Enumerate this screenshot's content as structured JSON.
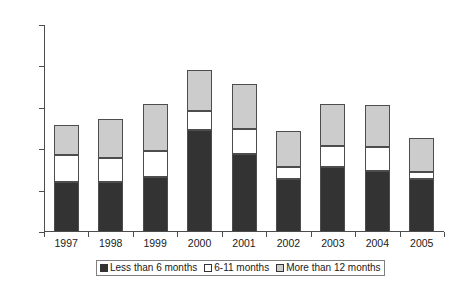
{
  "chart_data": {
    "type": "bar",
    "stacked": true,
    "title": "",
    "subtitle": "",
    "xlabel": "",
    "ylabel": "",
    "ylim": [
      0,
      25000
    ],
    "ytick_step": 5000,
    "ytick_labels": [
      "0",
      "5000",
      "10000",
      "15000",
      "20000",
      "25000"
    ],
    "ytick_values": [
      0,
      5000,
      10000,
      15000,
      20000,
      25000
    ],
    "grid": false,
    "legend_position": "bottom",
    "categories": [
      "1997",
      "1998",
      "1999",
      "2000",
      "2001",
      "2002",
      "2003",
      "2004",
      "2005"
    ],
    "series": [
      {
        "name": "Less than 6 months",
        "color": "#333333",
        "values": [
          6000,
          6000,
          6700,
          12300,
          9400,
          6400,
          7900,
          7400,
          6400
        ]
      },
      {
        "name": "6-11 months",
        "color": "#ffffff",
        "values": [
          3300,
          2950,
          3100,
          2300,
          3100,
          1400,
          2500,
          2900,
          800
        ]
      },
      {
        "name": "More than 12 months",
        "color": "#cccccc",
        "values": [
          3600,
          4750,
          5700,
          5000,
          5400,
          4400,
          5100,
          5000,
          4100
        ]
      }
    ],
    "totals": [
      12900,
      13700,
      15500,
      19600,
      17900,
      12200,
      15500,
      15300,
      11300
    ]
  },
  "legend": {
    "items": [
      {
        "label": "Less than 6 months"
      },
      {
        "label": "6-11 months"
      },
      {
        "label": "More than 12 months"
      }
    ]
  }
}
